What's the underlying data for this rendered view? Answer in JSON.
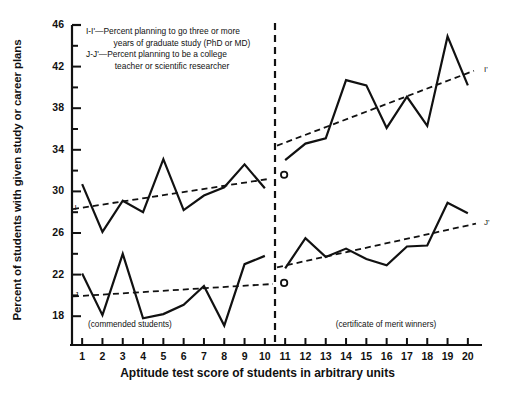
{
  "chart_data": {
    "type": "line",
    "title": "",
    "xlabel": "Aptitude test score of students in arbitrary units",
    "ylabel": "Percent of students with given study or career plans",
    "xlim": [
      0.5,
      20.5
    ],
    "ylim": [
      16.0,
      46.0
    ],
    "grid": false,
    "legend_position": "upper-left-inside",
    "x": [
      1,
      2,
      3,
      4,
      5,
      6,
      7,
      8,
      9,
      10,
      11,
      12,
      13,
      14,
      15,
      16,
      17,
      18,
      19,
      20
    ],
    "xticks": [
      "1",
      "2",
      "3",
      "4",
      "5",
      "6",
      "7",
      "8",
      "9",
      "10",
      "11",
      "12",
      "13",
      "14",
      "15",
      "16",
      "17",
      "18",
      "19",
      "20"
    ],
    "yticks_labeled": [
      "18",
      "22",
      "26",
      "30",
      "34",
      "38",
      "42",
      "46"
    ],
    "ytick_values_labeled": [
      18,
      22,
      26,
      30,
      34,
      38,
      42,
      46
    ],
    "ytick_minor_values": [
      20,
      24,
      28,
      32,
      36,
      40,
      44
    ],
    "series": [
      {
        "name": "I-I'",
        "key": "I",
        "style": "solid",
        "description": "Percent planning to go three or more years of graduate study (PhD or MD)",
        "segment_left_x": [
          1,
          2,
          3,
          4,
          5,
          6,
          7,
          8,
          9,
          10
        ],
        "segment_left_values": [
          30.7,
          26.1,
          29.1,
          28.0,
          33.1,
          28.2,
          29.6,
          30.4,
          32.6,
          30.3
        ],
        "segment_right_x": [
          11,
          12,
          13,
          14,
          15,
          16,
          17,
          18,
          19,
          20
        ],
        "segment_right_values": [
          33.0,
          34.6,
          35.1,
          40.7,
          40.2,
          36.1,
          39.1,
          36.3,
          44.9,
          40.2
        ]
      },
      {
        "name": "J-J'",
        "key": "J",
        "style": "solid",
        "description": "Percent planning to be a college teacher or scientific researcher",
        "segment_left_x": [
          1,
          2,
          3,
          4,
          5,
          6,
          7,
          8,
          9,
          10
        ],
        "segment_left_values": [
          22.1,
          18.1,
          24.0,
          17.8,
          18.2,
          19.1,
          20.9,
          17.1,
          23.0,
          23.8
        ],
        "segment_right_x": [
          11,
          12,
          13,
          14,
          15,
          16,
          17,
          18,
          19,
          20
        ],
        "segment_right_values": [
          22.6,
          25.5,
          23.7,
          24.5,
          23.5,
          22.9,
          24.7,
          24.8,
          28.9,
          27.9
        ]
      }
    ],
    "trendlines": [
      {
        "name": "I trend (commended)",
        "style": "dashed",
        "x0": 0.55,
        "y0": 28.3,
        "x1": 10.2,
        "y1": 31.2
      },
      {
        "name": "I' trend (merit winners)",
        "style": "dashed",
        "x0": 10.6,
        "y0": 34.4,
        "x1": 20.3,
        "y1": 41.6
      },
      {
        "name": "J trend (commended)",
        "style": "dashed",
        "x0": 0.55,
        "y0": 19.9,
        "x1": 10.4,
        "y1": 21.1
      },
      {
        "name": "J' trend (merit winners)",
        "style": "dashed",
        "x0": 10.6,
        "y0": 22.7,
        "x1": 20.4,
        "y1": 26.9
      }
    ],
    "markers": [
      {
        "name": "I-reference-point",
        "x": 10.95,
        "y": 31.6,
        "shape": "open-circle"
      },
      {
        "name": "J-reference-point",
        "x": 10.95,
        "y": 21.2,
        "shape": "open-circle"
      }
    ],
    "divider": {
      "name": "group-divider",
      "x": 10.5,
      "style": "dashed"
    },
    "annotations": [
      {
        "name": "commended-students-annotation",
        "text": "(commended students)",
        "x": 4.0,
        "y": 17.1
      },
      {
        "name": "merit-winners-annotation",
        "text": "(certificate of merit winners)",
        "x": 16.2,
        "y": 17.1
      }
    ],
    "curve_end_labels": [
      {
        "name": "label-I",
        "text": "I",
        "x": 0.72,
        "y": 28.3
      },
      {
        "name": "label-I-prime",
        "text": "I'",
        "x": 20.9,
        "y": 41.6
      },
      {
        "name": "label-J",
        "text": "J",
        "x": 0.72,
        "y": 19.9
      },
      {
        "name": "label-J-prime",
        "text": "J'",
        "x": 20.9,
        "y": 26.9
      }
    ]
  },
  "legend": {
    "line1": "I-I'—Percent planning to go three or more",
    "line2": "years of graduate study (PhD or MD)",
    "line3": "J-J'—Percent planning to be a college",
    "line4": "teacher or scientific researcher"
  },
  "axes": {
    "x_title": "Aptitude test score of students in arbitrary units",
    "y_title": "Percent of students with given study or career plans"
  },
  "colors": {
    "ink": "#111111",
    "background": "#ffffff"
  }
}
